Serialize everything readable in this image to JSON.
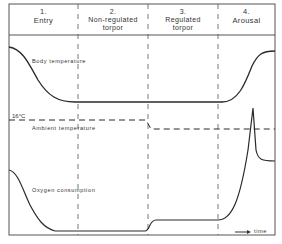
{
  "diagram": {
    "phases": [
      {
        "number": "1.",
        "name": "Entry"
      },
      {
        "number": "2.",
        "name": "Non-regulated torpor"
      },
      {
        "number": "3.",
        "name": "Regulated torpor"
      },
      {
        "number": "4.",
        "name": "Arousal"
      }
    ],
    "curves": {
      "body_temperature": "Body temperature",
      "ambient_temperature": "Ambient temperature",
      "oxygen_consumption": "Oxygen consumption"
    },
    "threshold_label": "16°C",
    "time_axis_label": "time",
    "line_color": "#2a2a2a"
  }
}
